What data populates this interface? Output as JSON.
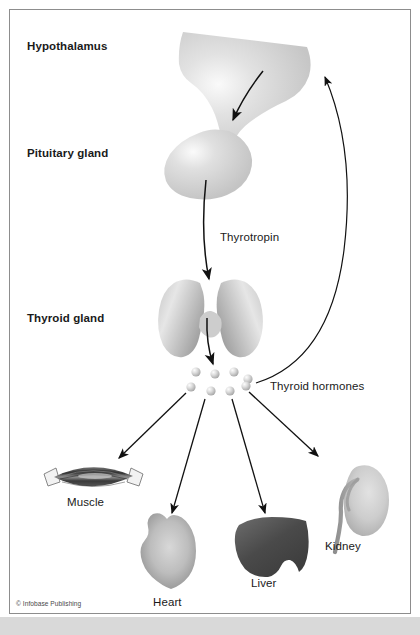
{
  "figure": {
    "frame": {
      "border_color": "#8d8d8d",
      "background": "#ffffff",
      "footer_strip_color": "#d9d9d9"
    },
    "labels": {
      "hypothalamus": "Hypothalamus",
      "pituitary_gland": "Pituitary gland",
      "thyroid_gland": "Thyroid gland",
      "thyrotropin": "Thyrotropin",
      "thyroid_hormones": "Thyroid hormones"
    },
    "organs": [
      {
        "id": "muscle",
        "label": "Muscle",
        "fill": "#4d4d4d"
      },
      {
        "id": "heart",
        "label": "Heart",
        "fill": "#b4b4b4"
      },
      {
        "id": "liver",
        "label": "Liver",
        "fill": "#4f4f4f"
      },
      {
        "id": "kidney",
        "label": "Kidney",
        "fill": "#c7c7c7"
      }
    ],
    "credit": "© Infobase Publishing",
    "colors": {
      "gland_fill": "#cfcfcf",
      "gland_highlight": "#f5f5f5",
      "hormone_dot": "#d2d2d2",
      "arrow": "#111111",
      "text": "#1a1a1a"
    },
    "hormone_dot_count": 8
  }
}
